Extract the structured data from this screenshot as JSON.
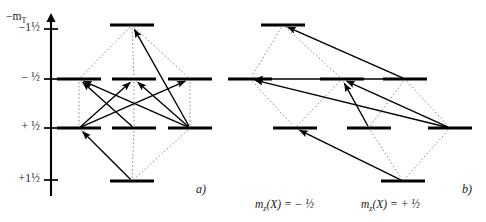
{
  "figure": {
    "type": "energy-level-transition-diagram",
    "width": 486,
    "height": 222,
    "background_color": "#ffffff",
    "ink_color": "#000000",
    "dotted_color": "#808080"
  },
  "axis": {
    "name_html": "−m<sub>T</sub>",
    "name_text": "-m_T",
    "arrow_direction": "up",
    "x": 51,
    "top_y": 14,
    "bottom_y": 196,
    "ticks": [
      {
        "label": "−1½",
        "value": -1.5,
        "y": 29
      },
      {
        "label": "−  ½",
        "value": -0.5,
        "y": 79
      },
      {
        "label": "+  ½",
        "value": 0.5,
        "y": 128
      },
      {
        "label": "+1½",
        "value": 1.5,
        "y": 180
      }
    ]
  },
  "panels": [
    {
      "id": "a",
      "label": "a)",
      "label_x": 196,
      "label_y": 182,
      "levels": [
        {
          "id": "a-top",
          "row": -1.5,
          "x": 110,
          "y": 25,
          "width": 44
        },
        {
          "id": "a-l1",
          "row": -0.5,
          "x": 57,
          "y": 79,
          "width": 44
        },
        {
          "id": "a-l2",
          "row": -0.5,
          "x": 112,
          "y": 79,
          "width": 44
        },
        {
          "id": "a-l3",
          "row": -0.5,
          "x": 168,
          "y": 79,
          "width": 44
        },
        {
          "id": "a-l4",
          "row": 0.5,
          "x": 57,
          "y": 128,
          "width": 44
        },
        {
          "id": "a-l5",
          "row": 0.5,
          "x": 112,
          "y": 128,
          "width": 44
        },
        {
          "id": "a-l6",
          "row": 0.5,
          "x": 168,
          "y": 128,
          "width": 44
        },
        {
          "id": "a-bot",
          "row": 1.5,
          "x": 110,
          "y": 181,
          "width": 44
        }
      ],
      "dotted_edges": [
        {
          "from": "a-top",
          "to": "a-l1"
        },
        {
          "from": "a-top",
          "to": "a-l2"
        },
        {
          "from": "a-top",
          "to": "a-l3"
        },
        {
          "from": "a-l1",
          "to": "a-l4"
        },
        {
          "from": "a-l2",
          "to": "a-l5"
        },
        {
          "from": "a-l3",
          "to": "a-l6"
        },
        {
          "from": "a-l1",
          "to": "a-l5"
        },
        {
          "from": "a-l2",
          "to": "a-l6"
        },
        {
          "from": "a-l4",
          "to": "a-bot"
        },
        {
          "from": "a-l5",
          "to": "a-bot"
        },
        {
          "from": "a-l6",
          "to": "a-bot"
        }
      ],
      "arrows": [
        {
          "from": "a-l6",
          "to": "a-top"
        },
        {
          "from": "a-l6",
          "to": "a-l1"
        },
        {
          "from": "a-l5",
          "to": "a-l1"
        },
        {
          "from": "a-l4",
          "to": "a-l2"
        },
        {
          "from": "a-l6",
          "to": "a-l2"
        },
        {
          "from": "a-l4",
          "to": "a-l3"
        },
        {
          "from": "a-bot",
          "to": "a-l4"
        }
      ]
    },
    {
      "id": "b",
      "label": "b)",
      "label_x": 462,
      "label_y": 182,
      "levels": [
        {
          "id": "b-top",
          "row": -1.5,
          "x": 261,
          "y": 25,
          "width": 44
        },
        {
          "id": "b-l1",
          "row": -0.5,
          "x": 228,
          "y": 79,
          "width": 44
        },
        {
          "id": "b-l2",
          "row": -0.5,
          "x": 320,
          "y": 79,
          "width": 44
        },
        {
          "id": "b-l3",
          "row": -0.5,
          "x": 383,
          "y": 79,
          "width": 44
        },
        {
          "id": "b-l4",
          "row": 0.5,
          "x": 273,
          "y": 128,
          "width": 44
        },
        {
          "id": "b-l5",
          "row": 0.5,
          "x": 347,
          "y": 128,
          "width": 44
        },
        {
          "id": "b-l6",
          "row": 0.5,
          "x": 428,
          "y": 128,
          "width": 44
        },
        {
          "id": "b-bot",
          "row": 1.5,
          "x": 381,
          "y": 181,
          "width": 44
        }
      ],
      "dotted_edges": [
        {
          "from": "b-top",
          "to": "b-l1"
        },
        {
          "from": "b-top",
          "to": "b-l2"
        },
        {
          "from": "b-top",
          "to": "b-l3"
        },
        {
          "from": "b-l1",
          "to": "b-l4"
        },
        {
          "from": "b-l2",
          "to": "b-l4"
        },
        {
          "from": "b-l2",
          "to": "b-l5"
        },
        {
          "from": "b-l3",
          "to": "b-l5"
        },
        {
          "from": "b-l3",
          "to": "b-l6"
        },
        {
          "from": "b-l4",
          "to": "b-bot"
        },
        {
          "from": "b-l5",
          "to": "b-bot"
        },
        {
          "from": "b-l6",
          "to": "b-bot"
        }
      ],
      "arrows": [
        {
          "from": "b-l3",
          "to": "b-top"
        },
        {
          "from": "b-l6",
          "to": "b-l1"
        },
        {
          "from": "b-l3",
          "to": "b-l1"
        },
        {
          "from": "b-l5",
          "to": "b-l2"
        },
        {
          "from": "b-l6",
          "to": "b-l2"
        },
        {
          "from": "b-bot",
          "to": "b-l4"
        }
      ]
    }
  ],
  "column_captions": [
    {
      "id": "caption-minus",
      "text": "m_z(X) =  − ½",
      "prefix": "m",
      "subscript": "z",
      "middle": "(X) = − ",
      "fraction": "½",
      "x": 255,
      "y": 198
    },
    {
      "id": "caption-plus",
      "text": "m_z(X) =  + ½",
      "prefix": "m",
      "subscript": "z",
      "middle": "(X) = + ",
      "fraction": "½",
      "x": 361,
      "y": 198
    }
  ]
}
